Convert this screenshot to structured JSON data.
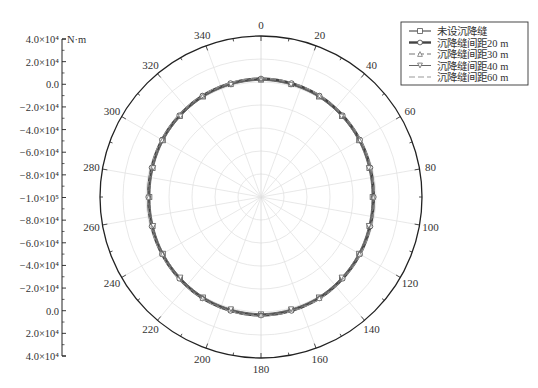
{
  "chart_data": {
    "type": "polar-line",
    "title": "",
    "radial_axis": {
      "unit": "N·m",
      "tick_labels": [
        "4.0×10⁴",
        "2.0×10⁴",
        "0.0",
        "−2.0×10⁴",
        "−4.0×10⁴",
        "−6.0×10⁴",
        "−8.0×10⁴",
        "−1.0×10⁵",
        "−8.0×10⁴",
        "−6.0×10⁴",
        "−4.0×10⁴",
        "−2.0×10⁴",
        "0.0",
        "2.0×10⁴",
        "4.0×10⁴"
      ],
      "center_value": -100000,
      "outer_value": 40000,
      "step": 20000
    },
    "angular_axis": {
      "tick_labels": [
        "0",
        "20",
        "40",
        "60",
        "80",
        "100",
        "120",
        "140",
        "160",
        "180",
        "200",
        "220",
        "240",
        "260",
        "280",
        "300",
        "320",
        "340"
      ],
      "direction": "clockwise",
      "zero_location": "top"
    },
    "legend": {
      "position": "top-right",
      "entries": [
        "未设沉降缝",
        "沉降缝间距20 m",
        "沉降缝间距30 m",
        "沉降缝间距40 m",
        "沉降缝间距60 m"
      ]
    },
    "theta": [
      0,
      15,
      30,
      45,
      60,
      75,
      90,
      105,
      120,
      135,
      150,
      165,
      180,
      195,
      210,
      225,
      240,
      255,
      270,
      285,
      300,
      315,
      330,
      345,
      360
    ],
    "series": [
      {
        "name": "未设沉降缝",
        "marker": "square",
        "style": "solid",
        "width": 1.2,
        "values": [
          2000,
          1500,
          800,
          -500,
          -1500,
          -2500,
          -3000,
          -2500,
          -1500,
          -500,
          800,
          1500,
          2000,
          1500,
          800,
          -500,
          -1500,
          -2500,
          -3000,
          -2500,
          -1500,
          -500,
          800,
          1500,
          2000
        ]
      },
      {
        "name": "沉降缝间距20 m",
        "marker": "circle",
        "style": "solid",
        "width": 2.4,
        "values": [
          3000,
          2500,
          1800,
          500,
          -500,
          -1500,
          -2000,
          -1500,
          -500,
          500,
          1800,
          2500,
          3000,
          2500,
          1800,
          500,
          -500,
          -1500,
          -2000,
          -1500,
          -500,
          500,
          1800,
          2500,
          3000
        ]
      },
      {
        "name": "沉降缝间距30 m",
        "marker": "triangle-up",
        "style": "dash",
        "width": 1.2,
        "values": [
          2500,
          2200,
          1500,
          0,
          -1000,
          -2000,
          -2500,
          -2000,
          -1000,
          0,
          1500,
          2200,
          2500,
          2200,
          1500,
          0,
          -1000,
          -2000,
          -2500,
          -2000,
          -1000,
          0,
          1500,
          2200,
          2500
        ]
      },
      {
        "name": "沉降缝间距40 m",
        "marker": "triangle-down",
        "style": "solid",
        "width": 1.0,
        "values": [
          1500,
          1000,
          300,
          -1000,
          -2000,
          -3000,
          -3500,
          -3000,
          -2000,
          -1000,
          300,
          1000,
          1500,
          1000,
          300,
          -1000,
          -2000,
          -3000,
          -3500,
          -3000,
          -2000,
          -1000,
          300,
          1000,
          1500
        ]
      },
      {
        "name": "沉降缝间距60 m",
        "marker": "none",
        "style": "dash",
        "width": 1.0,
        "values": [
          3500,
          3000,
          2300,
          1000,
          0,
          -1000,
          -1500,
          -1000,
          0,
          1000,
          2300,
          3000,
          3500,
          3000,
          2300,
          1000,
          0,
          -1000,
          -1500,
          -1000,
          0,
          1000,
          2300,
          3000,
          3500
        ]
      }
    ],
    "grid": true
  },
  "colors": {
    "axis": "#222222",
    "grid": "#e2e2e2",
    "series": [
      "#555555",
      "#444444",
      "#777777",
      "#666666",
      "#999999"
    ]
  }
}
